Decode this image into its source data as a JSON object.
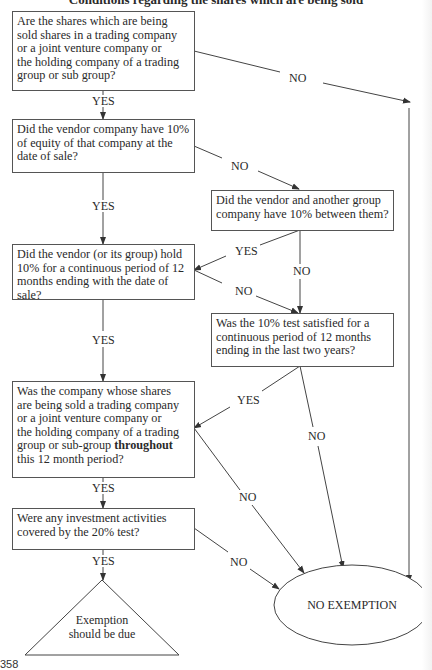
{
  "title": "Conditions regarding the shares which are being sold",
  "page_number": "358",
  "nodes": {
    "q1": {
      "text": "Are the shares which are being\nsold shares in a trading company\nor a joint venture company or\nthe holding company of a trading\ngroup or sub group?"
    },
    "q2": {
      "text": "Did the vendor company have 10%\nof equity of that company at the\ndate of sale?"
    },
    "q2b": {
      "text": "Did the vendor and another group\ncompany have 10% between them?"
    },
    "q3": {
      "text": "Did the vendor (or its group) hold\n10% for a continuous period of 12\nmonths ending with the date of sale?"
    },
    "q3b": {
      "text": "Was the 10% test satisfied for a\ncontinuous period of 12 months\nending in the last two years?"
    },
    "q4": {
      "text_before": "Was  the company whose shares\nare being sold a trading company\nor a joint venture company or\nthe holding company of a trading\ngroup or sub-group ",
      "text_bold": "throughout",
      "text_after": "\nthis 12 month period?"
    },
    "q5": {
      "text": "Were any investment activities\ncovered by the 20% test?"
    },
    "exempt": {
      "text": "Exemption\nshould be due",
      "shape": "triangle"
    },
    "no_exempt": {
      "text": "NO EXEMPTION",
      "shape": "ellipse"
    }
  },
  "edge_labels": {
    "q1_no": "NO",
    "q1_yes": "YES",
    "q2_no": "NO",
    "q2_yes": "YES",
    "q2b_yes": "YES",
    "q2b_no": "NO",
    "q3_no": "NO",
    "q3_yes": "YES",
    "q3b_yes": "YES",
    "q3b_no": "NO",
    "q4_no": "NO",
    "q4_yes": "YES",
    "q5_no": "NO",
    "q5_yes": "YES"
  },
  "colors": {
    "line": "#444444",
    "text": "#2a2a2a",
    "background": "#ffffff"
  }
}
